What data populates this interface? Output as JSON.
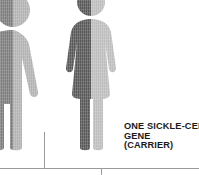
{
  "figures": [
    {
      "id": "male-figure",
      "name": "male-pictogram",
      "type": "male",
      "cropped": "left",
      "left_half_color": "#7c7c7c",
      "right_half_color": "#b2b2b2"
    },
    {
      "id": "female-figure",
      "name": "female-pictogram",
      "type": "female",
      "cropped": "none",
      "left_half_color": "#575757",
      "right_half_color": "#bdbdbd"
    }
  ],
  "caption": {
    "line1": "ONE SICKLE-CELL",
    "line2": "GENE",
    "line3": "(CARRIER)"
  },
  "rules": {
    "line_color": "#9a9a9a",
    "baseline_label": "axis-baseline",
    "divider_left_label": "column-divider-left",
    "tick_label": "axis-tick"
  },
  "colors": {
    "background": "#ffffff",
    "text": "#1a1a1a",
    "dark_gray": "#575757",
    "mid_gray": "#7c7c7c",
    "light_gray": "#bdbdbd",
    "pale_gray": "#b2b2b2",
    "rule_gray": "#9a9a9a"
  }
}
